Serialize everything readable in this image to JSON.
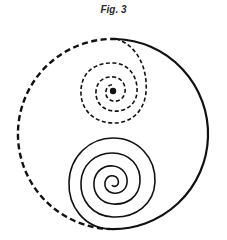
{
  "figure": {
    "caption": "Fig. 3",
    "stroke_color": "#111111",
    "background": "#ffffff",
    "outer_circle": {
      "center": [
        113,
        134
      ],
      "radius": 95,
      "left_half": "dashed",
      "right_half": "solid"
    },
    "upper_spiral": {
      "center": [
        113,
        90
      ],
      "style": "dashed",
      "turns": 4,
      "outer_radius": 33,
      "center_dot": true
    },
    "lower_spiral": {
      "center": [
        112,
        181
      ],
      "style": "solid",
      "turns": 5,
      "outer_radius": 44
    }
  }
}
